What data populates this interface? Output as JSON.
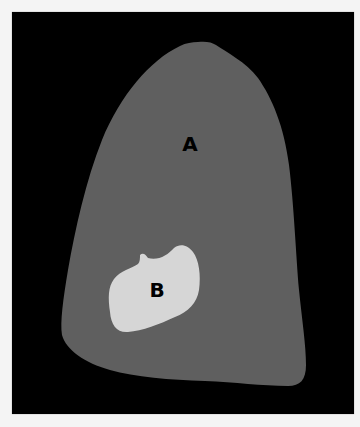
{
  "figure": {
    "background_color": "#000000",
    "region_a": {
      "label": "A",
      "fill": "#5f5f5f"
    },
    "region_b": {
      "label": "B",
      "fill": "#d6d6d6"
    }
  }
}
